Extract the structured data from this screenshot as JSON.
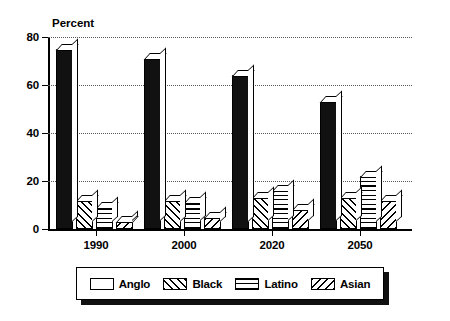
{
  "chart_data": {
    "type": "bar",
    "title": "",
    "ylabel": "Percent",
    "xlabel": "",
    "ylim": [
      0,
      80
    ],
    "yticks": [
      0,
      20,
      40,
      60,
      80
    ],
    "grid": true,
    "legend_position": "bottom",
    "categories": [
      "1990",
      "2000",
      "2020",
      "2050"
    ],
    "series": [
      {
        "name": "Anglo",
        "pattern": "solid-black",
        "values": [
          75,
          71,
          64,
          53
        ]
      },
      {
        "name": "Black",
        "pattern": "diagonal-forward",
        "values": [
          12,
          12,
          13,
          13
        ]
      },
      {
        "name": "Latino",
        "pattern": "cross-hatch-grid",
        "values": [
          9,
          11,
          16,
          22
        ]
      },
      {
        "name": "Asian",
        "pattern": "diagonal-back",
        "values": [
          3,
          5,
          8,
          12
        ]
      }
    ]
  },
  "colors": {
    "ink": "#000000",
    "background": "#ffffff",
    "gridline": "#555555",
    "anglo_fill": "#111111"
  }
}
